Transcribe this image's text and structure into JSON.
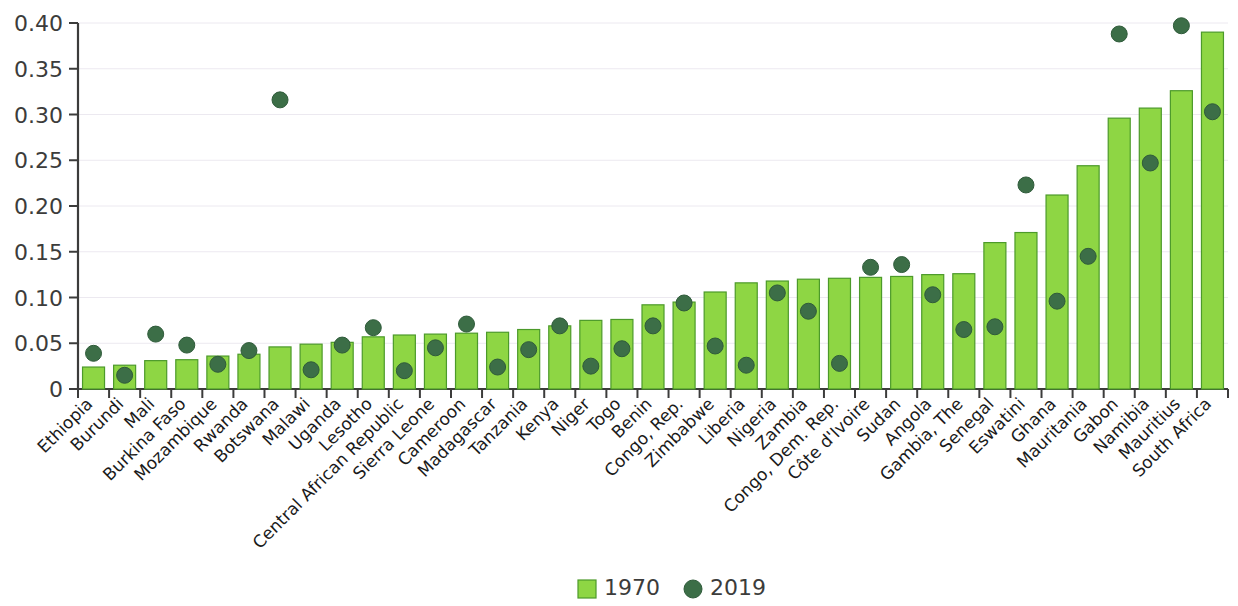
{
  "chart_data": {
    "type": "bar",
    "title": "",
    "subtitle": "",
    "xlabel": "",
    "ylabel": "",
    "ylim": [
      0,
      0.4
    ],
    "grid": true,
    "legend_position": "bottom-center",
    "ytick_labels": [
      "0",
      "0.05",
      "0.10",
      "0.15",
      "0.20",
      "0.25",
      "0.30",
      "0.35",
      "0.40"
    ],
    "ytick_values": [
      0,
      0.05,
      0.1,
      0.15,
      0.2,
      0.25,
      0.3,
      0.35,
      0.4
    ],
    "categories": [
      "Ethiopia",
      "Burundi",
      "Mali",
      "Burkina Faso",
      "Mozambique",
      "Rwanda",
      "Botswana",
      "Malawi",
      "Uganda",
      "Lesotho",
      "Central African Republic",
      "Sierra Leone",
      "Cameroon",
      "Madagascar",
      "Tanzania",
      "Kenya",
      "Niger",
      "Togo",
      "Benin",
      "Congo, Rep.",
      "Zimbabwe",
      "Liberia",
      "Nigeria",
      "Zambia",
      "Congo, Dem. Rep.",
      "Côte d'Ivoire",
      "Sudan",
      "Angola",
      "Gambia, The",
      "Senegal",
      "Eswatini",
      "Ghana",
      "Mauritania",
      "Gabon",
      "Namibia",
      "Mauritius",
      "South Africa"
    ],
    "series": [
      {
        "name": "1970",
        "marker": "bar",
        "color": "#8ed644",
        "values": [
          0.024,
          0.026,
          0.031,
          0.032,
          0.036,
          0.038,
          0.046,
          0.049,
          0.051,
          0.057,
          0.059,
          0.06,
          0.061,
          0.062,
          0.065,
          0.069,
          0.075,
          0.076,
          0.092,
          0.095,
          0.106,
          0.116,
          0.118,
          0.12,
          0.121,
          0.122,
          0.123,
          0.125,
          0.126,
          0.16,
          0.171,
          0.212,
          0.244,
          0.296,
          0.307,
          0.326,
          0.39
        ]
      },
      {
        "name": "2019",
        "marker": "dot",
        "color": "#3c6e47",
        "values": [
          0.039,
          0.015,
          0.06,
          0.048,
          0.027,
          0.042,
          0.316,
          0.021,
          0.048,
          0.067,
          0.02,
          0.045,
          0.071,
          0.024,
          0.043,
          0.069,
          0.025,
          0.044,
          0.069,
          0.094,
          0.047,
          0.026,
          0.105,
          0.085,
          0.028,
          0.133,
          0.136,
          0.103,
          0.065,
          0.068,
          0.223,
          0.096,
          0.145,
          0.388,
          0.247,
          0.397,
          0.303
        ]
      }
    ]
  },
  "legend": {
    "items": [
      {
        "label": "1970",
        "marker": "square",
        "color": "#8ed644"
      },
      {
        "label": "2019",
        "marker": "circle",
        "color": "#3c6e47"
      }
    ]
  },
  "colors": {
    "bar_fill": "#8ed644",
    "bar_stroke": "#4c9a2a",
    "dot_fill": "#3c6e47",
    "dot_stroke": "#2f5b3a",
    "grid": "#ece9f0",
    "axis": "#3c3c3b",
    "text": "#3c3c3b",
    "background": "#ffffff"
  }
}
